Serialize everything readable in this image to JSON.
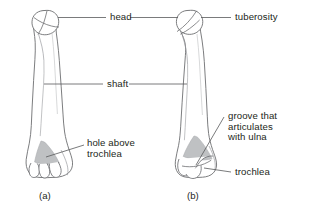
{
  "figure": {
    "background_color": "#ffffff",
    "outline_color": "#6d6e71",
    "shading_color": "#bcbec0",
    "leader_color": "#58595b",
    "text_color": "#231f20"
  },
  "labels": {
    "head": "head",
    "shaft": "shaft",
    "tuberosity": "tuberosity",
    "hole_above_trochlea_line1": "hole above",
    "hole_above_trochlea_line2": "trochlea",
    "groove_line1": "groove that",
    "groove_line2": "articulates",
    "groove_line3": "with ulna",
    "trochlea": "trochlea"
  },
  "captions": {
    "panel_a": "(a)",
    "panel_b": "(b)"
  }
}
